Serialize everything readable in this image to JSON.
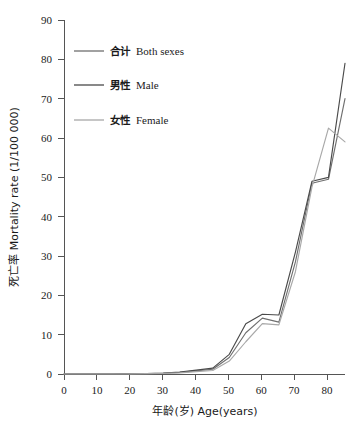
{
  "chart_data": {
    "type": "line",
    "title": "",
    "xlabel": "年龄(岁) Age(years)",
    "ylabel": "死亡率 Mortality rate (1/100 000)",
    "xlim": [
      0,
      85
    ],
    "ylim": [
      0,
      90
    ],
    "xticks": [
      0,
      10,
      20,
      30,
      40,
      50,
      60,
      70,
      80
    ],
    "yticks": [
      0,
      10,
      20,
      30,
      40,
      50,
      60,
      70,
      80,
      90
    ],
    "grid": false,
    "legend_position": "upper-left-inside",
    "x": [
      0,
      5,
      10,
      15,
      20,
      25,
      30,
      35,
      40,
      45,
      50,
      55,
      60,
      65,
      70,
      75,
      80,
      85
    ],
    "series": [
      {
        "name": "合计 Both sexes",
        "name_cn": "合计",
        "name_en": "Both sexes",
        "color": "#6f6f6f",
        "values": [
          0.0,
          0.0,
          0.0,
          0.0,
          0.05,
          0.1,
          0.2,
          0.4,
          0.8,
          1.2,
          4.2,
          10.5,
          14.2,
          13.2,
          28.5,
          48.5,
          49.5,
          70.0
        ]
      },
      {
        "name": "男性 Male",
        "name_cn": "男性",
        "name_en": "Male",
        "color": "#4a4a4a",
        "values": [
          0.0,
          0.0,
          0.0,
          0.0,
          0.05,
          0.12,
          0.25,
          0.5,
          1.0,
          1.5,
          5.0,
          12.8,
          15.2,
          15.0,
          31.0,
          49.0,
          50.0,
          79.0
        ]
      },
      {
        "name": "女性 Female",
        "name_cn": "女性",
        "name_en": "Female",
        "color": "#a8a8a8",
        "values": [
          0.0,
          0.0,
          0.0,
          0.0,
          0.03,
          0.08,
          0.15,
          0.3,
          0.6,
          0.9,
          3.3,
          8.2,
          12.8,
          12.5,
          26.0,
          47.5,
          62.5,
          59.0
        ]
      }
    ],
    "legend": [
      {
        "label_cn": "合计",
        "label_en": "Both sexes",
        "color": "#6f6f6f"
      },
      {
        "label_cn": "男性",
        "label_en": "Male",
        "color": "#4a4a4a"
      },
      {
        "label_cn": "女性",
        "label_en": "Female",
        "color": "#a8a8a8"
      }
    ]
  },
  "axes": {
    "y_tick_labels": [
      "0",
      "10",
      "20",
      "30",
      "40",
      "50",
      "60",
      "70",
      "80",
      "90"
    ],
    "x_tick_labels": [
      "0",
      "10",
      "20",
      "30",
      "40",
      "50",
      "60",
      "70",
      "80"
    ],
    "x_axis_title": "年龄(岁) Age(years)",
    "y_axis_title": "死亡率 Mortality rate (1/100 000)"
  },
  "colors": {
    "axis": "#555555",
    "text": "#1a1a1a",
    "background": "#ffffff",
    "both_sexes": "#6f6f6f",
    "male": "#4a4a4a",
    "female": "#a8a8a8"
  }
}
